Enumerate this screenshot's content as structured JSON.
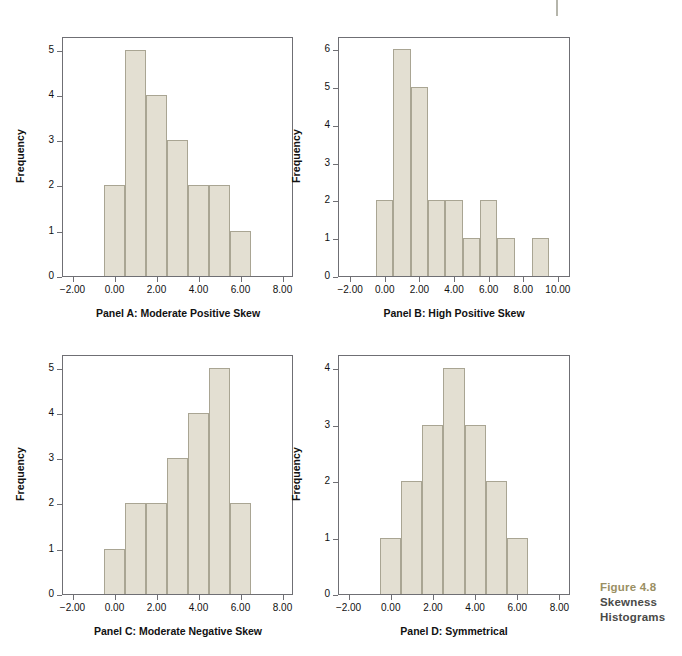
{
  "figure": {
    "number": "Figure 4.8",
    "title_line1": "Skewness",
    "title_line2": "Histograms",
    "number_color": "#9a8f63",
    "title_color": "#4a4a48"
  },
  "style": {
    "bar_fill": "#e3dfd2",
    "bar_stroke": "#a9a593",
    "axis_color": "#6f6f74"
  },
  "chart_data": [
    {
      "type": "bar",
      "id": "panel-a",
      "title": "Panel A: Moderate Positive Skew",
      "xlabel": "",
      "ylabel": "Frequency",
      "xlim": [
        -2.5,
        8.5
      ],
      "ylim": [
        0,
        5.3
      ],
      "xticks": [
        -2,
        0,
        2,
        4,
        6,
        8
      ],
      "xtick_labels": [
        "−2.00",
        "0.00",
        "2.00",
        "4.00",
        "6.00",
        "8.00"
      ],
      "yticks": [
        0,
        1,
        2,
        3,
        4,
        5
      ],
      "ytick_labels": [
        "0",
        "1",
        "2",
        "3",
        "4",
        "5"
      ],
      "bin_edges": [
        -0.5,
        0.5,
        1.5,
        2.5,
        3.5,
        4.5,
        5.5,
        6.5
      ],
      "bin_centers": [
        0,
        1,
        2,
        3,
        4,
        5,
        6
      ],
      "values": [
        2,
        5,
        4,
        3,
        2,
        2,
        1
      ],
      "grid": false,
      "legend": "none"
    },
    {
      "type": "bar",
      "id": "panel-b",
      "title": "Panel B: High Positive Skew",
      "xlabel": "",
      "ylabel": "Frequency",
      "xlim": [
        -2.7,
        10.7
      ],
      "ylim": [
        0,
        6.35
      ],
      "xticks": [
        -2,
        0,
        2,
        4,
        6,
        8,
        10
      ],
      "xtick_labels": [
        "−2.00",
        "0.00",
        "2.00",
        "4.00",
        "6.00",
        "8.00",
        "10.00"
      ],
      "yticks": [
        0,
        1,
        2,
        3,
        4,
        5,
        6
      ],
      "ytick_labels": [
        "0",
        "1",
        "2",
        "3",
        "4",
        "5",
        "6"
      ],
      "bin_edges": [
        -0.5,
        0.5,
        1.5,
        2.5,
        3.5,
        4.5,
        5.5,
        6.5,
        7.5,
        8.5,
        9.5
      ],
      "bin_centers": [
        0,
        1,
        2,
        3,
        4,
        5,
        6,
        7,
        8,
        9
      ],
      "values": [
        2,
        6,
        5,
        2,
        2,
        1,
        2,
        1,
        0,
        1
      ],
      "grid": false,
      "legend": "none"
    },
    {
      "type": "bar",
      "id": "panel-c",
      "title": "Panel C: Moderate Negative Skew",
      "xlabel": "",
      "ylabel": "Frequency",
      "xlim": [
        -2.5,
        8.5
      ],
      "ylim": [
        0,
        5.3
      ],
      "xticks": [
        -2,
        0,
        2,
        4,
        6,
        8
      ],
      "xtick_labels": [
        "−2.00",
        "0.00",
        "2.00",
        "4.00",
        "6.00",
        "8.00"
      ],
      "yticks": [
        0,
        1,
        2,
        3,
        4,
        5
      ],
      "ytick_labels": [
        "0",
        "1",
        "2",
        "3",
        "4",
        "5"
      ],
      "bin_edges": [
        -0.5,
        0.5,
        1.5,
        2.5,
        3.5,
        4.5,
        5.5,
        6.5
      ],
      "bin_centers": [
        0,
        1,
        2,
        3,
        4,
        5,
        6
      ],
      "values": [
        1,
        2,
        2,
        3,
        4,
        5,
        2
      ],
      "grid": false,
      "legend": "none"
    },
    {
      "type": "bar",
      "id": "panel-d",
      "title": "Panel D: Symmetrical",
      "xlabel": "",
      "ylabel": "Frequency",
      "xlim": [
        -2.5,
        8.5
      ],
      "ylim": [
        0,
        4.25
      ],
      "xticks": [
        -2,
        0,
        2,
        4,
        6,
        8
      ],
      "xtick_labels": [
        "−2.00",
        "0.00",
        "2.00",
        "4.00",
        "6.00",
        "8.00"
      ],
      "yticks": [
        0,
        1,
        2,
        3,
        4
      ],
      "ytick_labels": [
        "0",
        "1",
        "2",
        "3",
        "4"
      ],
      "bin_edges": [
        -0.5,
        0.5,
        1.5,
        2.5,
        3.5,
        4.5,
        5.5,
        6.5
      ],
      "bin_centers": [
        0,
        1,
        2,
        3,
        4,
        5,
        6
      ],
      "values": [
        1,
        2,
        3,
        4,
        3,
        2,
        1
      ],
      "grid": false,
      "legend": "none"
    }
  ]
}
